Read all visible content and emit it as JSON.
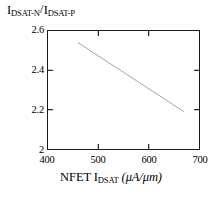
{
  "chart_data": {
    "type": "line",
    "title": "",
    "subtitle": "",
    "xlabel_text": "NFET I",
    "xlabel_sub": "DSAT",
    "xlabel_units": "(μA/μm)",
    "xlabel_full": "NFET I_DSAT (μA/μm)",
    "ylabel_num_main": "I",
    "ylabel_num_sub": "DSAT-N",
    "ylabel_slash": "/",
    "ylabel_den_main": "I",
    "ylabel_den_sub": "DSAT-P",
    "ylabel_full": "I_DSAT-N / I_DSAT-P",
    "xlim": [
      400,
      700
    ],
    "ylim": [
      2,
      2.6
    ],
    "xticks": [
      400,
      500,
      600,
      700
    ],
    "xtick_labels": [
      "400",
      "500",
      "600",
      "700"
    ],
    "yticks": [
      2,
      2.2,
      2.4,
      2.6
    ],
    "ytick_labels": [
      "2",
      "2.2",
      "2.4",
      "2.6"
    ],
    "grid": false,
    "legend": null,
    "legend_position": "none",
    "frame": "box",
    "tick_direction": "in",
    "series": [
      {
        "name": "IDSAT-N/IDSAT-P vs NFET IDSAT",
        "color": "#999999",
        "line_width": 0.9,
        "marker": "none",
        "x": [
          460,
          490,
          520,
          550,
          580,
          610,
          640,
          670
        ],
        "y": [
          2.54,
          2.49,
          2.44,
          2.39,
          2.34,
          2.29,
          2.24,
          2.19
        ]
      }
    ],
    "annotations": []
  },
  "figure": {
    "background_color": "#ffffff",
    "axis_color": "#1a1a1a",
    "text_color": "#000000",
    "line_color": "#999999"
  }
}
